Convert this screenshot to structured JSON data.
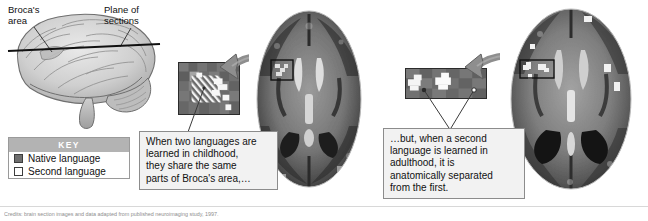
{
  "figure": {
    "labels": {
      "brocas_area": "Broca's\narea",
      "plane_of_sections": "Plane of\nsections"
    },
    "key": {
      "title": "KEY",
      "items": [
        {
          "label": "Native language",
          "swatch": "filled-dark-gray-square",
          "color": "#6e6e6e"
        },
        {
          "label": "Second language",
          "swatch": "empty-white-square",
          "color": "#ffffff"
        }
      ]
    },
    "callouts": [
      {
        "id": "left",
        "text": "When two languages are\nlearned in childhood,\nthey share the same\nparts of Broca's area,…"
      },
      {
        "id": "right",
        "text": "…but, when a second\nlanguage is learned in\nadulthood, it is\nanatomically separated\nfrom the first."
      }
    ],
    "panels": [
      {
        "id": "left-scan",
        "name": "childhood-bilingual-mri",
        "description": "Axial MRI brain section, early bilingual",
        "inset_description": "Magnified Broca's area: hatched native-language activation overlapping white second-language activation"
      },
      {
        "id": "right-scan",
        "name": "adulthood-bilingual-mri",
        "description": "Axial MRI brain section, late bilingual",
        "inset_description": "Magnified Broca's area: native and second language activations spatially separate"
      }
    ],
    "footnote": "Credits: brain section images and data adapted from published neuroimaging study, 1997."
  }
}
